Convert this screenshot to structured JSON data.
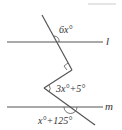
{
  "diagram": {
    "type": "geometry-parallel-lines",
    "lines": {
      "upper_label": "l",
      "lower_label": "m"
    },
    "angles": {
      "top": "6x°",
      "middle": "3x°+5°",
      "bottom": "x°+125°"
    },
    "right_angle_marker": true,
    "colors": {
      "stroke": "#555555",
      "text": "#333333"
    }
  }
}
